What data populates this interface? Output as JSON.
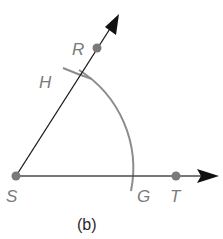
{
  "figure": {
    "caption": "(b)",
    "colors": {
      "ray": "#1a1a1a",
      "arc": "#8c8c8c",
      "point": "#7a7a7a",
      "label": "#7a7a7a",
      "caption": "#2a2a2a"
    },
    "points": {
      "S": {
        "label": "S",
        "x": 16,
        "y": 176
      },
      "T": {
        "label": "T",
        "x": 176,
        "y": 176
      },
      "R": {
        "label": "R",
        "x": 97,
        "y": 48
      },
      "H": {
        "label": "H",
        "x": 79,
        "y": 77
      },
      "G": {
        "label": "G",
        "x": 130,
        "y": 176
      }
    },
    "rays": [
      {
        "name": "ray-ST",
        "from": "S",
        "through": "T"
      },
      {
        "name": "ray-SR",
        "from": "S",
        "through": "R"
      }
    ],
    "arcs": [
      {
        "name": "compass-arc-center-S",
        "center": "S",
        "passes_through": [
          "H",
          "G"
        ]
      },
      {
        "name": "compass-arc-mark-at-H",
        "near": "H"
      }
    ]
  }
}
